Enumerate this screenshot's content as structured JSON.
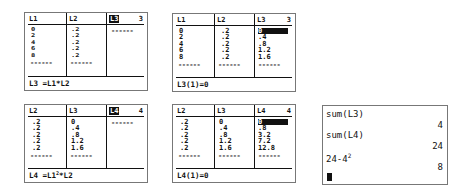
{
  "screens": [
    {
      "id": "screen1",
      "columns": [
        {
          "header": "L1",
          "values": [
            "0",
            "2",
            "4",
            "6",
            "8"
          ]
        },
        {
          "header": "L2",
          "values": [
            ".2",
            ".2",
            ".2",
            ".2",
            ".2"
          ]
        },
        {
          "header": "L3",
          "values": [],
          "selected_header": true
        }
      ],
      "column_number": "3",
      "dashes": "------",
      "footer": {
        "text": "L3 =L1*L2"
      }
    },
    {
      "id": "screen2",
      "columns": [
        {
          "header": "L1",
          "values": [
            "0",
            "2",
            "4",
            "6",
            "8"
          ]
        },
        {
          "header": "L2",
          "values": [
            ".2",
            ".2",
            ".2",
            ".2",
            ".2"
          ]
        },
        {
          "header": "L3",
          "values": [
            "0",
            ".4",
            ".8",
            "1.2",
            "1.6"
          ],
          "selected_row": 0
        }
      ],
      "column_number": "3",
      "dashes": "------",
      "footer": {
        "text": "L3(1)=0"
      }
    },
    {
      "id": "screen3",
      "columns": [
        {
          "header": "L2",
          "values": [
            ".2",
            ".2",
            ".2",
            ".2",
            ".2"
          ]
        },
        {
          "header": "L3",
          "values": [
            "0",
            ".4",
            ".8",
            "1.2",
            "1.6"
          ]
        },
        {
          "header": "L4",
          "values": [],
          "selected_header": true
        }
      ],
      "column_number": "4",
      "dashes": "------",
      "footer": {
        "prefix": "L4 =L1",
        "sup": "2",
        "suffix": "*L2"
      }
    },
    {
      "id": "screen4",
      "columns": [
        {
          "header": "L2",
          "values": [
            ".2",
            ".2",
            ".2",
            ".2",
            ".2"
          ]
        },
        {
          "header": "L3",
          "values": [
            "0",
            ".4",
            ".8",
            "1.2",
            "1.6"
          ]
        },
        {
          "header": "L4",
          "values": [
            "0",
            ".8",
            "3.2",
            "7.2",
            "12.8"
          ],
          "selected_row": 0
        }
      ],
      "column_number": "4",
      "dashes": "------",
      "footer": {
        "text": "L4(1)=0"
      }
    }
  ],
  "home_screen": {
    "entries": [
      {
        "input": "sum(L3)",
        "result": "4"
      },
      {
        "input": "sum(L4)",
        "result": "24"
      },
      {
        "input_base": "24-4",
        "input_sup": "2",
        "result": "8"
      }
    ]
  }
}
